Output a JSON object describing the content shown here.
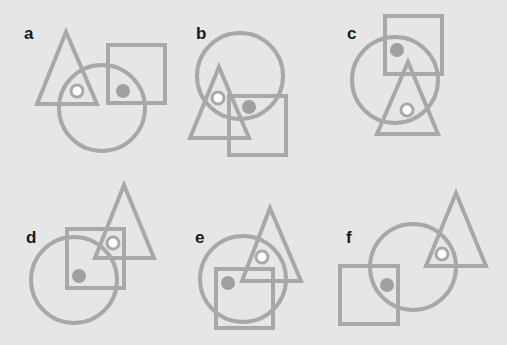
{
  "colors": {
    "background": "#e6e6e6",
    "stroke": "#a8a8a8",
    "dot_gray": "#a0a0a0",
    "dot_white": "#ffffff",
    "label": "#1a1a1a"
  },
  "panels": [
    {
      "label": "a",
      "label_pos": [
        24,
        39
      ],
      "triangle": [
        [
          66,
          32
        ],
        [
          37,
          104
        ],
        [
          97,
          104
        ]
      ],
      "square": {
        "x": 108,
        "y": 45,
        "w": 57,
        "h": 58
      },
      "circle": {
        "cx": 102,
        "cy": 108,
        "r": 43
      },
      "white_dot": [
        77,
        91
      ],
      "gray_dot": [
        123,
        91
      ]
    },
    {
      "label": "b",
      "label_pos": [
        196,
        39
      ],
      "triangle": [
        [
          219,
          67
        ],
        [
          190,
          138
        ],
        [
          249,
          138
        ]
      ],
      "square": {
        "x": 229,
        "y": 96,
        "w": 57,
        "h": 59
      },
      "circle": {
        "cx": 240,
        "cy": 76,
        "r": 43
      },
      "white_dot": [
        218,
        98
      ],
      "gray_dot": [
        249,
        107
      ]
    },
    {
      "label": "c",
      "label_pos": [
        347,
        39
      ],
      "triangle": [
        [
          408,
          62
        ],
        [
          377,
          134
        ],
        [
          438,
          134
        ]
      ],
      "square": {
        "x": 385,
        "y": 16,
        "w": 57,
        "h": 58
      },
      "circle": {
        "cx": 395,
        "cy": 80,
        "r": 43
      },
      "white_dot": [
        407,
        110
      ],
      "gray_dot": [
        397,
        50
      ]
    },
    {
      "label": "d",
      "label_pos": [
        26,
        243
      ],
      "triangle": [
        [
          124,
          185
        ],
        [
          95,
          258
        ],
        [
          154,
          258
        ]
      ],
      "square": {
        "x": 67,
        "y": 229,
        "w": 57,
        "h": 59
      },
      "circle": {
        "cx": 74,
        "cy": 280,
        "r": 43
      },
      "white_dot": [
        113,
        243
      ],
      "gray_dot": [
        79,
        276
      ]
    },
    {
      "label": "e",
      "label_pos": [
        195,
        243
      ],
      "triangle": [
        [
          270,
          208
        ],
        [
          242,
          281
        ],
        [
          301,
          281
        ]
      ],
      "square": {
        "x": 216,
        "y": 269,
        "w": 57,
        "h": 59
      },
      "circle": {
        "cx": 243,
        "cy": 279,
        "r": 43
      },
      "white_dot": [
        262,
        257
      ],
      "gray_dot": [
        228,
        283
      ]
    },
    {
      "label": "f",
      "label_pos": [
        346,
        243
      ],
      "triangle": [
        [
          456,
          193
        ],
        [
          426,
          266
        ],
        [
          486,
          266
        ]
      ],
      "square": {
        "x": 340,
        "y": 266,
        "w": 58,
        "h": 58
      },
      "circle": {
        "cx": 413,
        "cy": 267,
        "r": 43
      },
      "white_dot": [
        442,
        254
      ],
      "gray_dot": [
        387,
        285
      ]
    }
  ]
}
